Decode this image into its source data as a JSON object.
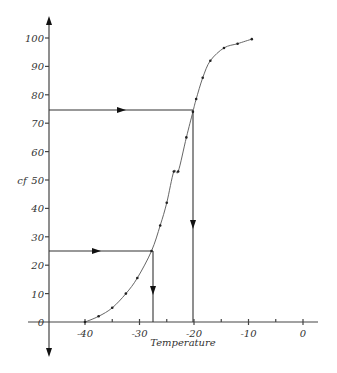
{
  "chart_data": {
    "type": "line",
    "title": "",
    "xlabel": "Temperature",
    "ylabel": "cf",
    "xlim": [
      -45,
      2
    ],
    "ylim": [
      0,
      100
    ],
    "x_ticks": [
      -40,
      -30,
      -20,
      -10,
      0
    ],
    "x_minor_ticks": [
      -35,
      -25,
      -15,
      -5
    ],
    "y_ticks": [
      0,
      10,
      20,
      30,
      40,
      50,
      60,
      70,
      80,
      90,
      100
    ],
    "grid": false,
    "legend": null,
    "series": [
      {
        "name": "cf",
        "x": [
          -40,
          -37.5,
          -35,
          -32.5,
          -30.4,
          -27.8,
          -26.2,
          -25,
          -23.7,
          -22.9,
          -21.4,
          -20.2,
          -19.6,
          -18.4,
          -17,
          -14.5,
          -12,
          -9.4
        ],
        "y": [
          0,
          2,
          5,
          10,
          15.5,
          25,
          34,
          42,
          53,
          53,
          65,
          74,
          78.5,
          86,
          92,
          96.5,
          98,
          99.6
        ]
      }
    ],
    "annotations": [
      {
        "type": "guide",
        "description": "horizontal arrow from cf=75 to curve, then vertical arrow down to T=-20",
        "cf": 75,
        "temperature": -20
      },
      {
        "type": "guide",
        "description": "horizontal arrow from cf=25 to curve, then vertical arrow down to T=-27.5",
        "cf": 25,
        "temperature": -27.5
      }
    ]
  },
  "labels": {
    "xlabel": "Temperature",
    "ylabel": "cf",
    "x_ticks": [
      "-40",
      "-30",
      "-20",
      "-10",
      "0"
    ],
    "y_ticks": [
      "0",
      "10",
      "20",
      "30",
      "40",
      "50",
      "60",
      "70",
      "80",
      "90",
      "100"
    ]
  },
  "colors": {
    "axis": "#444444",
    "curve": "#555555",
    "points": "#222222",
    "background": "#ffffff"
  }
}
